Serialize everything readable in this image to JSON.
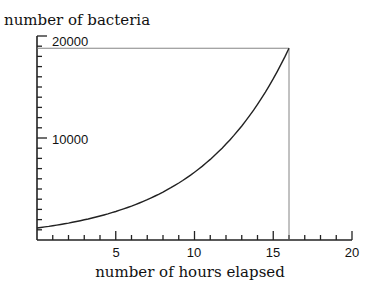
{
  "chart_data": {
    "type": "line",
    "title": "",
    "xlabel": "number of hours elapsed",
    "ylabel": "number of bacteria",
    "xlim": [
      0,
      20
    ],
    "ylim": [
      0,
      20000
    ],
    "x_ticks_labeled": [
      5,
      10,
      15,
      20
    ],
    "x_minor_tick_step": 1,
    "y_ticks_labeled": [
      10000,
      20000
    ],
    "y_minor_tick_step": 1000,
    "grid": false,
    "legend": null,
    "series": [
      {
        "name": "bacteria growth",
        "function": "N(t) = 1175 * 2^(t/4)",
        "x": [
          0,
          2,
          4,
          6,
          8,
          10,
          12,
          14,
          16
        ],
        "values": [
          1175,
          1662,
          2350,
          3323,
          4700,
          6647,
          9400,
          13294,
          18800
        ]
      }
    ],
    "annotations": [
      {
        "type": "reference-line-horizontal",
        "y": 18800,
        "from_x": 0,
        "to_x": 16
      },
      {
        "type": "reference-line-vertical",
        "x": 16,
        "from_y": 0,
        "to_y": 18800
      }
    ]
  },
  "labels": {
    "y_axis_title": "number of bacteria",
    "x_axis_title": "number of hours elapsed",
    "y_tick_10000": "10000",
    "y_tick_20000": "20000",
    "x_tick_5": "5",
    "x_tick_10": "10",
    "x_tick_15": "15",
    "x_tick_20": "20"
  }
}
